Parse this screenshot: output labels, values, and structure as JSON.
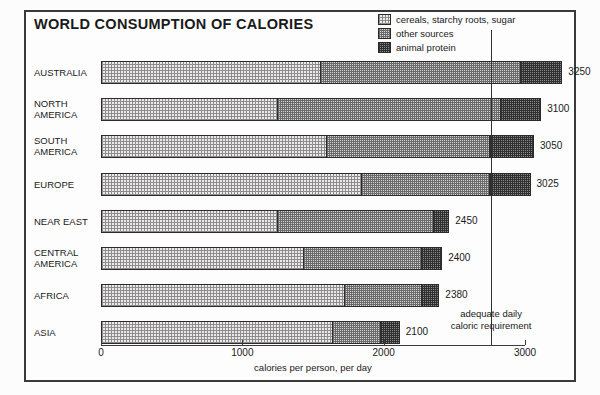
{
  "title": "WORLD CONSUMPTION OF CALORIES",
  "legend": {
    "items": [
      {
        "label": "cereals, starchy roots, sugar",
        "pattern": "light",
        "swatch_icon": "legend-swatch-light"
      },
      {
        "label": "other sources",
        "pattern": "mid",
        "swatch_icon": "legend-swatch-mid"
      },
      {
        "label": "animal protein",
        "pattern": "dark",
        "swatch_icon": "legend-swatch-dark"
      }
    ]
  },
  "annotation": {
    "text": "adequate daily\ncaloric requirement",
    "value": 2760
  },
  "axis": {
    "ticks": [
      0,
      1000,
      2000,
      3000
    ],
    "tick_labels": [
      "0",
      "1000",
      "2000",
      "3000"
    ],
    "xlabel": "calories per person, per day"
  },
  "chart_data": {
    "type": "bar",
    "orientation": "horizontal",
    "stacked": true,
    "title": "WORLD CONSUMPTION OF CALORIES",
    "xlabel": "calories per person, per day",
    "ylabel": "",
    "xlim": [
      0,
      3000
    ],
    "grid": false,
    "legend_position": "top-right",
    "categories": [
      "AUSTRALIA",
      "NORTH\nAMERICA",
      "SOUTH\nAMERICA",
      "EUROPE",
      "NEAR EAST",
      "CENTRAL\nAMERICA",
      "AFRICA",
      "ASIA"
    ],
    "series": [
      {
        "name": "cereals, starchy roots, sugar",
        "values": [
          1545,
          1240,
          1585,
          1835,
          1240,
          1425,
          1715,
          1625
        ]
      },
      {
        "name": "other sources",
        "values": [
          1410,
          1575,
          1150,
          900,
          1105,
          835,
          545,
          340
        ]
      },
      {
        "name": "animal protein",
        "values": [
          295,
          285,
          315,
          290,
          105,
          140,
          120,
          135
        ]
      }
    ],
    "totals": [
      3250,
      3100,
      3050,
      3025,
      2450,
      2400,
      2380,
      2100
    ],
    "total_labels": [
      "3250",
      "3100",
      "3050",
      "3025",
      "2450",
      "2400",
      "2380",
      "2100"
    ],
    "reference_line": {
      "value": 2760,
      "label": "adequate daily caloric requirement"
    }
  },
  "colors": {
    "frame": "#3a3a3a",
    "ink": "#1a1a1a",
    "light": "#eceaea",
    "mid": "#d8d6d6",
    "dark": "#8c8a8a"
  }
}
